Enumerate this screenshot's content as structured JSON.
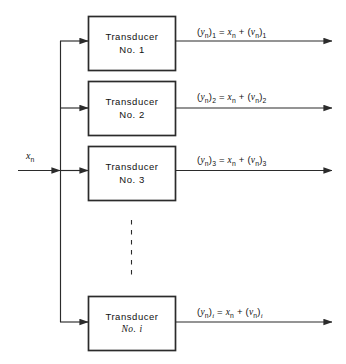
{
  "diagram": {
    "background_color": "#ffffff",
    "line_color": "#2b2b2b",
    "text_color": "#111111",
    "input": {
      "label_base": "x",
      "label_sub": "n",
      "name": "input-signal-label"
    },
    "blocks": [
      {
        "line1": "Transducer",
        "line2": "No. 1",
        "index": "1"
      },
      {
        "line1": "Transducer",
        "line2": "No. 2",
        "index": "2"
      },
      {
        "line1": "Transducer",
        "line2": "No. 3",
        "index": "3"
      },
      {
        "line1": "Transducer",
        "line2": "No. i",
        "index": "i"
      }
    ],
    "outputs": [
      {
        "y_base": "y",
        "y_sub": "n",
        "out_index": "1",
        "equals": "=",
        "x_base": "x",
        "x_sub": "n",
        "plus": "+",
        "nu_base": "ν",
        "nu_sub": "n",
        "nu_index": "1"
      },
      {
        "y_base": "y",
        "y_sub": "n",
        "out_index": "2",
        "equals": "=",
        "x_base": "x",
        "x_sub": "n",
        "plus": "+",
        "nu_base": "ν",
        "nu_sub": "n",
        "nu_index": "2"
      },
      {
        "y_base": "y",
        "y_sub": "n",
        "out_index": "3",
        "equals": "=",
        "x_base": "x",
        "x_sub": "n",
        "plus": "+",
        "nu_base": "ν",
        "nu_sub": "n",
        "nu_index": "3"
      },
      {
        "y_base": "y",
        "y_sub": "n",
        "out_index": "i",
        "equals": "=",
        "x_base": "x",
        "x_sub": "n",
        "plus": "+",
        "nu_base": "ν",
        "nu_sub": "n",
        "nu_index": "i"
      }
    ],
    "ellipsis": {
      "name": "vertical-dashed-ellipsis",
      "style": "dashed"
    }
  }
}
